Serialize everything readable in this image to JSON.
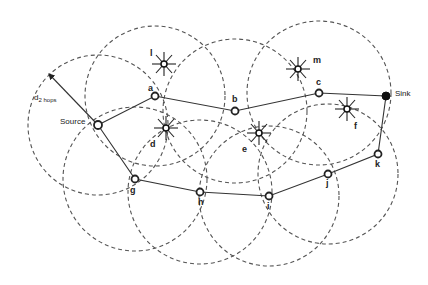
{
  "figure": {
    "radius_label": "d",
    "radius_subscript": "2 hops",
    "nodes": {
      "source": {
        "label": "Source",
        "x": 98,
        "y": 125
      },
      "a": {
        "label": "a",
        "x": 155,
        "y": 96
      },
      "b": {
        "label": "b",
        "x": 235,
        "y": 111
      },
      "c": {
        "label": "c",
        "x": 319,
        "y": 93
      },
      "sink": {
        "label": "Sink",
        "x": 386,
        "y": 96
      },
      "g": {
        "label": "g",
        "x": 135,
        "y": 179
      },
      "h": {
        "label": "h",
        "x": 200,
        "y": 192
      },
      "i": {
        "label": "i",
        "x": 269,
        "y": 196
      },
      "j": {
        "label": "j",
        "x": 328,
        "y": 174
      },
      "k": {
        "label": "k",
        "x": 378,
        "y": 154
      }
    },
    "interferers": {
      "l": {
        "label": "l",
        "x": 164,
        "y": 64
      },
      "d": {
        "label": "d",
        "x": 166,
        "y": 128
      },
      "e": {
        "label": "e",
        "x": 259,
        "y": 133
      },
      "m": {
        "label": "m",
        "x": 298,
        "y": 69
      },
      "f": {
        "label": "f",
        "x": 347,
        "y": 109
      }
    },
    "paths": [
      [
        "source",
        "a",
        "b",
        "c",
        "sink"
      ],
      [
        "source",
        "g",
        "h",
        "i",
        "j",
        "k",
        "sink"
      ]
    ]
  }
}
